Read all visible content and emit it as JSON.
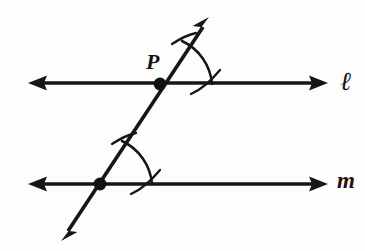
{
  "figure": {
    "kind": "geometry-diagram",
    "background_color": "#fdfdfc",
    "ink_color": "#161616"
  },
  "labels": {
    "point_P": "P",
    "line_l": "ℓ",
    "line_m": "m"
  },
  "lines": [
    {
      "name": "line-l",
      "label": "ℓ",
      "kind": "double-arrow-line",
      "x1": 30,
      "y1": 83,
      "x2": 326,
      "y2": 83
    },
    {
      "name": "line-m",
      "label": "m",
      "kind": "double-arrow-line",
      "x1": 30,
      "y1": 184,
      "x2": 326,
      "y2": 184
    },
    {
      "name": "transversal",
      "label": "",
      "kind": "double-arrow-line",
      "x1": 62,
      "y1": 240,
      "x2": 208,
      "y2": 19
    }
  ],
  "points": [
    {
      "name": "point-P",
      "label": "P",
      "x": 160,
      "y": 84
    },
    {
      "name": "point-lower-intersection",
      "label": "",
      "x": 100,
      "y": 184
    }
  ],
  "arcs": [
    {
      "name": "angle-arc-upper",
      "center_x": 160,
      "center_y": 84,
      "radius": 52
    },
    {
      "name": "angle-arc-lower",
      "center_x": 100,
      "center_y": 184,
      "radius": 52
    },
    {
      "name": "tick-arc-upper-transversal",
      "note": "small arc crossing transversal above P"
    },
    {
      "name": "tick-arc-upper-line",
      "note": "small arc crossing line l right of P"
    },
    {
      "name": "tick-arc-lower-transversal",
      "note": "small arc crossing transversal above lower point"
    },
    {
      "name": "tick-arc-lower-line",
      "note": "small arc crossing line m right of lower point"
    }
  ],
  "colors": {
    "ink": "#161616",
    "dot": "#121212",
    "background": "#fdfdfc"
  }
}
